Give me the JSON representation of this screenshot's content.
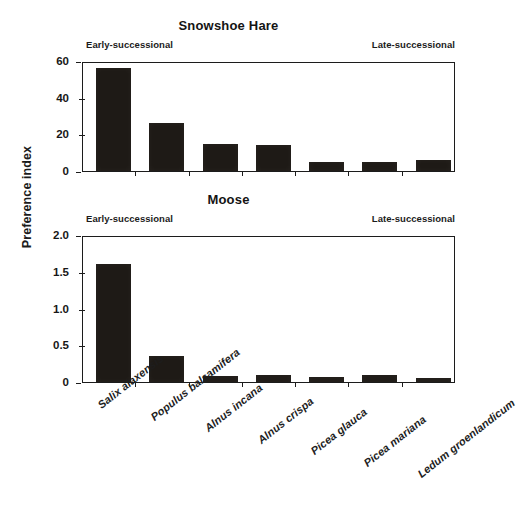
{
  "figure": {
    "y_axis_title": "Preference index",
    "background": "#ffffff",
    "bar_color": "#1e1a16",
    "axis_color": "#1c1c1c"
  },
  "categories": [
    "Salix alaxensis",
    "Populus balsamifera",
    "Alnus incana",
    "Alnus crispa",
    "Picea glauca",
    "Picea mariana",
    "Ledum groenlandicum"
  ],
  "annotations": {
    "early": "Early-successional",
    "late": "Late-successional"
  },
  "panels": [
    {
      "title": "Snowshoe Hare",
      "yticks": [
        "0",
        "20",
        "40",
        "60"
      ]
    },
    {
      "title": "Moose",
      "yticks": [
        "0",
        "0.5",
        "1.0",
        "1.5",
        "2.0"
      ]
    }
  ],
  "chart_data": [
    {
      "type": "bar",
      "title": "Snowshoe Hare",
      "xlabel": "",
      "ylabel": "Preference index",
      "categories": [
        "Salix alaxensis",
        "Populus balsamifera",
        "Alnus incana",
        "Alnus crispa",
        "Picea glauca",
        "Picea mariana",
        "Ledum groenlandicum"
      ],
      "values": [
        56,
        26,
        15,
        14,
        5,
        5,
        6
      ],
      "ylim": [
        0,
        60
      ],
      "ytick_values": [
        0,
        20,
        40,
        60
      ],
      "grid": false,
      "legend": "none",
      "annotations": [
        "Early-successional",
        "Late-successional"
      ]
    },
    {
      "type": "bar",
      "title": "Moose",
      "xlabel": "",
      "ylabel": "Preference index",
      "categories": [
        "Salix alaxensis",
        "Populus balsamifera",
        "Alnus incana",
        "Alnus crispa",
        "Picea glauca",
        "Picea mariana",
        "Ledum groenlandicum"
      ],
      "values": [
        1.6,
        0.35,
        0.08,
        0.1,
        0.07,
        0.09,
        0.06
      ],
      "ylim": [
        0,
        2.0
      ],
      "ytick_values": [
        0,
        0.5,
        1.0,
        1.5,
        2.0
      ],
      "grid": false,
      "legend": "none",
      "annotations": [
        "Early-successional",
        "Late-successional"
      ]
    }
  ]
}
